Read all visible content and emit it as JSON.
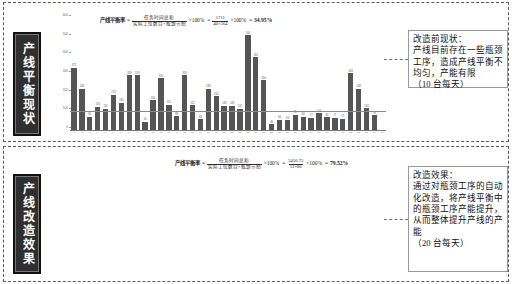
{
  "panels": {
    "top": {
      "vertical_title": "产线平衡现状",
      "formula": {
        "label": "产线平衡率",
        "eq1": "=",
        "numerator": "任务时间总和",
        "denominator": "实际工位数目×瓶颈节拍",
        "times1": "×100%",
        "eq2": "=",
        "numerator2": "1711",
        "denominator2": "40×564",
        "times2": "×100%",
        "eq3": "=",
        "result": "34.95%"
      },
      "callout": "改造前现状：\n产线目前存在一些瓶颈工序，造成产线平衡不均匀，产能有限\n（10 台每天）"
    },
    "bottom": {
      "vertical_title": "产线改造效果",
      "formula": {
        "label": "产线平衡率",
        "eq1": "=",
        "numerator": "任务时间总和",
        "denominator": "实际工位数目×瓶颈节拍",
        "times1": "×100%",
        "eq2": "=",
        "numerator2": "3456.75",
        "denominator2": "51×86",
        "times2": "×100%",
        "eq3": "=",
        "result": "79.52%"
      },
      "callout": "改造效果：\n通过对瓶颈工序的自动化改造，将产线平衡中的瓶颈工序产能提升，从而整体提升产线的产能\n（20 台每天）"
    }
  },
  "chart_data": [
    {
      "type": "bar",
      "title": "产线平衡现状",
      "xlabel": "",
      "ylabel": "",
      "ylim": [
        0,
        600
      ],
      "yticks": [
        0,
        100,
        200,
        300,
        400,
        500,
        600
      ],
      "grid": false,
      "legend": "none",
      "average_line": 112,
      "categories": [
        "1",
        "2",
        "3",
        "4",
        "5",
        "6",
        "7",
        "8",
        "9",
        "10",
        "11",
        "12",
        "13",
        "14",
        "15",
        "16",
        "17",
        "18",
        "19",
        "20",
        "21",
        "22",
        "23",
        "24",
        "25",
        "26",
        "27",
        "28",
        "29",
        "30",
        "31",
        "32",
        "33",
        "34",
        "35",
        "36",
        "37",
        "38",
        "39",
        "40"
      ],
      "values": [
        372,
        248,
        84,
        143,
        131,
        213,
        165,
        329,
        329,
        54,
        180,
        310,
        155,
        88,
        329,
        152,
        68,
        248,
        204,
        148,
        148,
        131,
        564,
        434,
        300,
        40,
        66,
        63,
        95,
        84,
        77,
        104,
        80,
        77,
        71,
        340,
        248,
        134,
        93,
        0
      ],
      "annotations": [
        "产线平衡率 = 任务时间总和 / (实际工位数目×瓶颈节拍) ×100% = 1711/(40×564) ×100% = 34.95%"
      ]
    },
    {
      "type": "bar",
      "title": "产线改造效果",
      "xlabel": "",
      "ylabel": "",
      "ylim": [
        0,
        100
      ],
      "yticks": [
        0,
        20,
        40,
        60,
        80,
        100
      ],
      "grid": false,
      "legend": "none",
      "average_line": 0,
      "categories": [
        "1",
        "2",
        "3",
        "4",
        "5",
        "6",
        "7",
        "8",
        "9",
        "10",
        "11",
        "12",
        "13",
        "14",
        "15",
        "16",
        "17",
        "18",
        "19",
        "20",
        "21",
        "22",
        "23",
        "24",
        "25",
        "26",
        "27",
        "28",
        "29",
        "30",
        "31",
        "32",
        "33",
        "34",
        "35",
        "36",
        "37",
        "38",
        "39",
        "40",
        "41",
        "42",
        "43",
        "44",
        "45",
        "46",
        "47",
        "48",
        "49",
        "50",
        "51"
      ],
      "values": [
        86,
        60,
        86,
        68,
        70,
        84,
        66,
        76,
        88,
        46,
        56,
        86,
        64,
        72,
        78,
        88,
        58,
        82,
        84,
        56,
        86,
        62,
        86,
        78,
        44,
        30,
        84,
        74,
        58,
        86,
        86,
        80,
        86,
        78,
        70,
        68,
        62,
        86,
        58,
        86,
        84,
        58,
        58,
        58,
        86,
        86,
        84,
        78,
        58,
        86,
        60
      ],
      "annotations": [
        "产线平衡率 = 任务时间总和 / (实际工位数目×瓶颈节拍) ×100% = 3456.75/(51×86) ×100% = 79.52%"
      ]
    }
  ]
}
